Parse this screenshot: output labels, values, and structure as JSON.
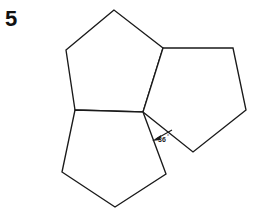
{
  "figure": {
    "problem_number": "5",
    "background_color": "#ffffff",
    "stroke_color": "#1a1a1a",
    "shapes": [
      {
        "name": "pentagon-top-left",
        "points": "114,10 66,50 75,110 143,112 163,48"
      },
      {
        "name": "pentagon-right",
        "points": "163,48 233,48 246,110 193,152 143,112"
      },
      {
        "name": "pentagon-bottom",
        "points": "75,110 143,112 166,174 115,207 62,172"
      }
    ],
    "angle_label": {
      "name": "gap-angle-label",
      "value": "36",
      "degree_symbol": "°",
      "text_x": 158,
      "text_y": 142,
      "leader_line": "172,130 156,139",
      "arrow_tip_x": 152,
      "arrow_tip_y": 141
    }
  }
}
